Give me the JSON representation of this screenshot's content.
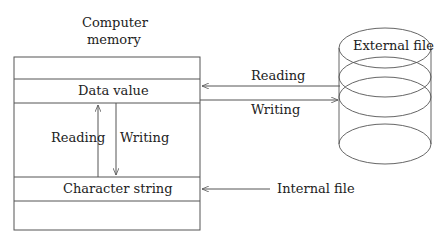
{
  "diagram": {
    "memory": {
      "title_line1": "Computer",
      "title_line2": "memory",
      "data_value": "Data value",
      "character_string": "Character string",
      "reading": "Reading",
      "writing": "Writing"
    },
    "external": {
      "label": "External file",
      "reading": "Reading",
      "writing": "Writing"
    },
    "internal": {
      "label": "Internal file"
    },
    "colors": {
      "line": "#555555",
      "text": "#222222"
    }
  }
}
